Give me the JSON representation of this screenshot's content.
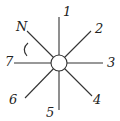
{
  "diagram": {
    "type": "radial-lines-from-circle",
    "center": {
      "x": 59,
      "y": 63,
      "radius": 8
    },
    "colors": {
      "stroke": "#333333",
      "text": "#222222",
      "background": "#ffffff"
    },
    "rays": [
      {
        "id": "N",
        "label": "N",
        "x2": 27,
        "y2": 31,
        "lx": 16,
        "ly": 31
      },
      {
        "id": "1",
        "label": "1",
        "x2": 59,
        "y2": 17,
        "lx": 63,
        "ly": 16
      },
      {
        "id": "2",
        "label": "2",
        "x2": 91,
        "y2": 31,
        "lx": 95,
        "ly": 33
      },
      {
        "id": "3",
        "label": "3",
        "x2": 103,
        "y2": 63,
        "lx": 107,
        "ly": 67
      },
      {
        "id": "4",
        "label": "4",
        "x2": 92,
        "y2": 96,
        "lx": 93,
        "ly": 104
      },
      {
        "id": "5",
        "label": "5",
        "x2": 59,
        "y2": 110,
        "lx": 46,
        "ly": 117
      },
      {
        "id": "6",
        "label": "6",
        "x2": 25,
        "y2": 98,
        "lx": 9,
        "ly": 104
      },
      {
        "id": "7",
        "label": "7",
        "x2": 14,
        "y2": 63,
        "lx": 5,
        "ly": 66
      }
    ],
    "angle_marker": {
      "between": [
        "N",
        "7"
      ],
      "shape": "arc"
    }
  }
}
